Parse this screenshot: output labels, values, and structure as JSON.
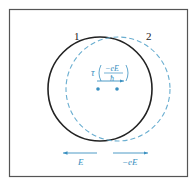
{
  "diagram": {
    "circles": [
      {
        "label": "1",
        "style": "solid",
        "color": "#222222"
      },
      {
        "label": "2",
        "style": "dashed",
        "color": "#6aaed0"
      }
    ],
    "shift_label": {
      "tau": "τ",
      "numerator": "−eE",
      "denominator": "ħ"
    },
    "field_arrows": [
      {
        "label": "E",
        "direction": "left"
      },
      {
        "label": "−eE",
        "direction": "right"
      }
    ],
    "colors": {
      "frame": "#555555",
      "circle_solid": "#222222",
      "circle_dashed": "#6aaed0",
      "accent": "#3a90c0"
    }
  }
}
